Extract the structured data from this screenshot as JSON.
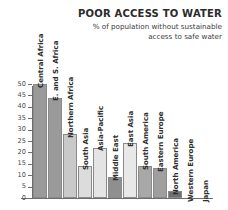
{
  "header": {
    "title": "POOR ACCESS TO WATER",
    "subtitle_line1": "% of population without sustainable",
    "subtitle_line2": "access to safe water"
  },
  "chart_data": {
    "type": "bar",
    "title": "POOR ACCESS TO WATER",
    "subtitle": "% of population without sustainable access to safe water",
    "xlabel": "",
    "ylabel": "",
    "ylim": [
      0,
      50
    ],
    "grid": false,
    "legend": "none",
    "yticks": [
      0,
      5,
      10,
      15,
      20,
      25,
      30,
      35,
      40,
      45,
      50
    ],
    "ytick_labels": [
      "0",
      "5",
      "10",
      "15",
      "20",
      "25",
      "30",
      "35",
      "40",
      "45",
      "50"
    ],
    "categories": [
      "Central Africa",
      "E. and S. Africa",
      "Northern Africa",
      "South Asia",
      "Asia-Pacific",
      "Middle East",
      "East Asia",
      "South America",
      "Eastern Europe",
      "North America",
      "Western Europe",
      "Japan"
    ],
    "values": [
      50,
      44,
      28,
      14,
      22,
      9,
      24,
      14,
      13,
      3,
      0,
      0
    ],
    "bar_colors": [
      "#9a9a9a",
      "#9a9a9a",
      "#c9c9c9",
      "#dcdcdc",
      "#e4e4e4",
      "#8f8f8f",
      "#e8e8e8",
      "#a8a8a8",
      "#9f9f9f",
      "#707070",
      "#ffffff",
      "#ffffff"
    ]
  },
  "colors": {
    "axis": "#6d6d6d",
    "text": "#2e2e2e",
    "background": "#ffffff"
  }
}
